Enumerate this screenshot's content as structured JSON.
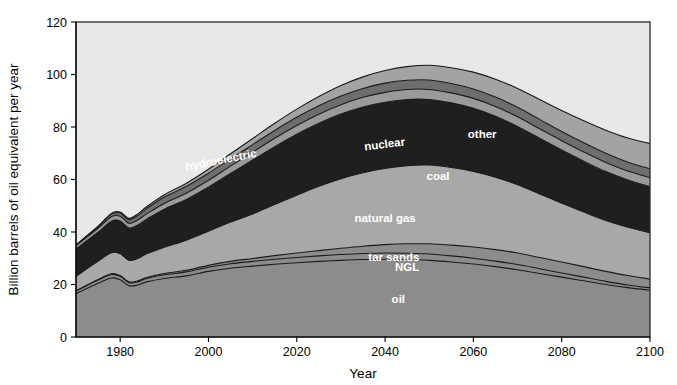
{
  "chart_data": {
    "type": "area",
    "stacked": true,
    "title": "",
    "xlabel": "Year",
    "ylabel": "Billion barrels of oil equivalent per year",
    "xlim": [
      1970,
      2100
    ],
    "ylim": [
      0,
      120
    ],
    "xticks": [
      1980,
      2000,
      2020,
      2040,
      2060,
      2080,
      2100
    ],
    "yticks": [
      0,
      20,
      40,
      60,
      80,
      100,
      120
    ],
    "grid": false,
    "legend": "in-place labels on bands",
    "x": [
      1970,
      1975,
      1978,
      1980,
      1982,
      1984,
      1986,
      1990,
      1995,
      2000,
      2005,
      2010,
      2015,
      2020,
      2025,
      2030,
      2035,
      2040,
      2045,
      2050,
      2055,
      2060,
      2065,
      2070,
      2075,
      2080,
      2085,
      2090,
      2095,
      2100
    ],
    "series": [
      {
        "name": "oil",
        "color": "#8c8c8c",
        "values": [
          16.5,
          20.5,
          22.5,
          21.8,
          19.5,
          19.8,
          21.0,
          22.3,
          23.3,
          25.0,
          26.2,
          27.0,
          27.7,
          28.3,
          28.8,
          29.2,
          29.5,
          29.6,
          29.5,
          29.2,
          28.6,
          27.8,
          26.8,
          25.6,
          24.2,
          22.8,
          21.4,
          20.0,
          18.8,
          17.8
        ]
      },
      {
        "name": "NGL",
        "color": "#8c8c8c",
        "values": [
          1.0,
          1.2,
          1.3,
          1.3,
          1.2,
          1.2,
          1.3,
          1.4,
          1.5,
          1.6,
          1.7,
          1.8,
          1.9,
          2.0,
          2.1,
          2.2,
          2.3,
          2.4,
          2.4,
          2.4,
          2.3,
          2.2,
          2.1,
          2.0,
          1.8,
          1.6,
          1.4,
          1.2,
          1.0,
          0.9
        ]
      },
      {
        "name": "tar sands",
        "color": "#8c8c8c",
        "values": [
          0.1,
          0.2,
          0.3,
          0.3,
          0.3,
          0.4,
          0.4,
          0.5,
          0.6,
          0.7,
          0.9,
          1.1,
          1.4,
          1.7,
          2.0,
          2.4,
          2.8,
          3.2,
          3.6,
          3.9,
          4.1,
          4.3,
          4.4,
          4.4,
          4.3,
          4.2,
          4.0,
          3.8,
          3.6,
          3.4
        ]
      },
      {
        "name": "natural gas",
        "color": "#a8a8a8",
        "values": [
          5.5,
          7.0,
          8.0,
          8.3,
          8.2,
          8.5,
          9.0,
          10.0,
          11.5,
          13.0,
          15.0,
          17.0,
          19.5,
          22.0,
          24.5,
          26.5,
          28.0,
          29.0,
          29.8,
          30.0,
          29.6,
          28.8,
          27.6,
          26.0,
          24.2,
          22.4,
          20.8,
          19.4,
          18.4,
          17.6
        ]
      },
      {
        "name": "coal",
        "color": "#1f1f1f",
        "values": [
          10.5,
          11.0,
          12.0,
          12.5,
          12.3,
          12.8,
          13.2,
          14.5,
          15.5,
          16.8,
          18.5,
          20.5,
          22.0,
          23.2,
          24.0,
          24.6,
          25.0,
          25.2,
          25.2,
          25.0,
          24.6,
          24.0,
          23.2,
          22.2,
          21.2,
          20.2,
          19.4,
          18.6,
          18.0,
          17.6
        ]
      },
      {
        "name": "hydroelectric",
        "color": "#9a9a9a",
        "values": [
          1.2,
          1.5,
          1.7,
          1.8,
          1.8,
          1.9,
          2.0,
          2.2,
          2.4,
          2.6,
          2.8,
          3.0,
          3.2,
          3.4,
          3.5,
          3.6,
          3.7,
          3.8,
          3.8,
          3.8,
          3.8,
          3.8,
          3.7,
          3.7,
          3.6,
          3.6,
          3.5,
          3.5,
          3.4,
          3.4
        ]
      },
      {
        "name": "nuclear",
        "color": "#6e6e6e",
        "values": [
          0.2,
          0.6,
          1.0,
          1.2,
          1.4,
          1.7,
          2.0,
          2.4,
          2.6,
          2.7,
          2.8,
          2.9,
          3.0,
          3.1,
          3.2,
          3.3,
          3.4,
          3.5,
          3.5,
          3.6,
          3.6,
          3.6,
          3.6,
          3.6,
          3.6,
          3.5,
          3.5,
          3.5,
          3.4,
          3.4
        ]
      },
      {
        "name": "other",
        "color": "#a3a3a3",
        "values": [
          0.1,
          0.2,
          0.3,
          0.4,
          0.5,
          0.6,
          0.7,
          0.9,
          1.2,
          1.5,
          1.9,
          2.3,
          2.7,
          3.1,
          3.5,
          4.0,
          4.4,
          4.8,
          5.2,
          5.6,
          6.0,
          6.4,
          6.8,
          7.2,
          7.6,
          8.0,
          8.4,
          8.8,
          9.2,
          9.6
        ]
      }
    ],
    "band_labels": [
      {
        "name": "oil",
        "x": 2043,
        "y": 13
      },
      {
        "name": "NGL",
        "x": 2045,
        "y": 25
      },
      {
        "name": "tar sands",
        "x": 2042,
        "y": 29
      },
      {
        "name": "natural gas",
        "x": 2040,
        "y": 44
      },
      {
        "name": "coal",
        "x": 2052,
        "y": 60
      },
      {
        "name": "nuclear",
        "x": 2040,
        "y": 72
      },
      {
        "name": "hydroelectric",
        "x": 2003,
        "y": 66
      },
      {
        "name": "other",
        "x": 2062,
        "y": 76
      }
    ],
    "plot_background": "#e8e8e8",
    "figure_background": "#ffffff"
  },
  "caption": {
    "fragment": ""
  }
}
